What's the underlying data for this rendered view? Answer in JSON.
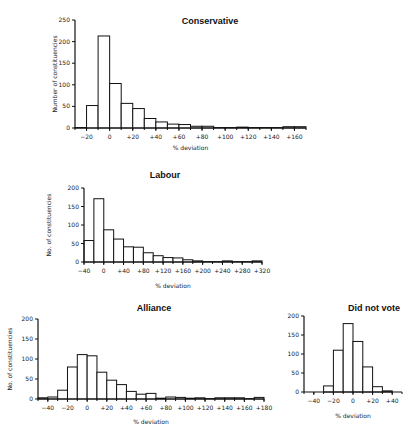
{
  "chart_data": [
    {
      "id": "conservative",
      "type": "bar",
      "title": "Conservative",
      "xlabel": "% deviation",
      "ylabel": "Number of constituencies",
      "ylim": [
        0,
        250
      ],
      "yticks": [
        0,
        50,
        100,
        150,
        200,
        250
      ],
      "xlim": [
        -30,
        170
      ],
      "xticks": [
        -20,
        0,
        20,
        40,
        60,
        80,
        100,
        120,
        140,
        160
      ],
      "xtick_labels": [
        "−20",
        "0",
        "+20",
        "+40",
        "+60",
        "+80",
        "+100",
        "+120",
        "+140",
        "+160"
      ],
      "bin_width": 10,
      "bin_starts": [
        -30,
        -20,
        -10,
        0,
        10,
        20,
        30,
        40,
        50,
        60,
        70,
        80,
        90,
        100,
        110,
        120,
        130,
        140,
        150,
        160
      ],
      "values": [
        1,
        52,
        213,
        103,
        57,
        45,
        22,
        14,
        9,
        8,
        4,
        4,
        1,
        1,
        2,
        1,
        1,
        1,
        3,
        3
      ],
      "grid": false
    },
    {
      "id": "labour",
      "type": "bar",
      "title": "Labour",
      "xlabel": "% deviation",
      "ylabel": "No. of constituencies",
      "ylim": [
        0,
        200
      ],
      "yticks": [
        0,
        50,
        100,
        150,
        200
      ],
      "xlim": [
        -40,
        320
      ],
      "xticks": [
        -40,
        0,
        40,
        80,
        120,
        160,
        200,
        240,
        280,
        320
      ],
      "xtick_labels": [
        "−40",
        "0",
        "+40",
        "+80",
        "+120",
        "+160",
        "+200",
        "+240",
        "+280",
        "+320"
      ],
      "bin_width": 20,
      "bin_starts": [
        -40,
        -20,
        0,
        20,
        40,
        60,
        80,
        100,
        120,
        140,
        160,
        180,
        200,
        220,
        240,
        260,
        280,
        300
      ],
      "values": [
        58,
        171,
        87,
        62,
        41,
        40,
        25,
        17,
        12,
        11,
        6,
        3,
        1,
        1,
        3,
        1,
        1,
        3
      ],
      "grid": false
    },
    {
      "id": "alliance",
      "type": "bar",
      "title": "Alliance",
      "xlabel": "% deviation",
      "ylabel": "No. of constituencies",
      "ylim": [
        0,
        200
      ],
      "yticks": [
        0,
        50,
        100,
        150,
        200
      ],
      "xlim": [
        -50,
        180
      ],
      "xticks": [
        -40,
        -20,
        0,
        20,
        40,
        60,
        80,
        100,
        120,
        140,
        160,
        180
      ],
      "xtick_labels": [
        "−40",
        "−20",
        "0",
        "+20",
        "+40",
        "+60",
        "+80",
        "+100",
        "+120",
        "+140",
        "+160",
        "+180"
      ],
      "bin_width": 10,
      "bin_starts": [
        -50,
        -40,
        -30,
        -20,
        -10,
        0,
        10,
        20,
        30,
        40,
        50,
        60,
        70,
        80,
        90,
        100,
        110,
        120,
        130,
        140,
        150,
        160,
        170
      ],
      "values": [
        3,
        5,
        22,
        80,
        111,
        108,
        67,
        47,
        36,
        19,
        12,
        14,
        2,
        5,
        4,
        2,
        3,
        1,
        3,
        3,
        3,
        1,
        4
      ],
      "grid": false
    },
    {
      "id": "did-not-vote",
      "type": "bar",
      "title": "Did not vote",
      "xlabel": "% deviation",
      "ylabel": "No. of constituencies",
      "ylim": [
        0,
        200
      ],
      "yticks": [
        0,
        50,
        100,
        150,
        200
      ],
      "xlim": [
        -50,
        50
      ],
      "xticks": [
        -40,
        -20,
        0,
        20,
        40
      ],
      "xtick_labels": [
        "−40",
        "−20",
        "0",
        "+20",
        "+40"
      ],
      "bin_width": 10,
      "bin_starts": [
        -30,
        -20,
        -10,
        0,
        10,
        20,
        30
      ],
      "values": [
        16,
        110,
        180,
        133,
        66,
        14,
        3
      ],
      "grid": false
    }
  ]
}
